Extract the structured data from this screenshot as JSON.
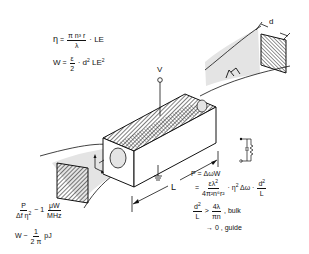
{
  "equations": {
    "eta": {
      "lhs": "η",
      "eq": "=",
      "num": "π n³ r",
      "den": "λ",
      "rhs": "· LE"
    },
    "w1": {
      "lhs": "W",
      "eq": "=",
      "num": "ε",
      "den": "2",
      "rhs_pre": "· d",
      "rhs_sup1": "2",
      "rhs_mid": " LE",
      "rhs_sup2": "2"
    },
    "p_ratio": {
      "num": "P",
      "den_pre": "Δf η",
      "den_sup": "2",
      "rel": "~ 1",
      "unit_num": "μW",
      "unit_den": "MHz"
    },
    "w2": {
      "lhs": "W",
      "rel": "~",
      "num": "1",
      "den": "2 π",
      "rhs": "pJ"
    },
    "p1": {
      "text": "P = ΔωW"
    },
    "p2": {
      "eq": "=",
      "num_pre": "ελ",
      "num_sup": "2",
      "den": "4π²n⁶r²",
      "mid_pre": "· η",
      "mid_sup": "2",
      "mid_post": " Δω ·",
      "frac2_num_pre": "d",
      "frac2_num_sup": "2",
      "frac2_den": "L"
    },
    "cond1": {
      "num_pre": "d",
      "num_sup": "2",
      "den": "L",
      "rel": ">",
      "frac_num": "4λ",
      "frac_den": "πn",
      "suffix": ", bulk"
    },
    "cond2": {
      "text": "→ 0 , guide"
    }
  },
  "labels": {
    "voltage": "V",
    "length": "L",
    "aperture": "d"
  },
  "colors": {
    "ink": "#111111",
    "beam_fill": "#e4e4e4",
    "background": "#ffffff"
  }
}
